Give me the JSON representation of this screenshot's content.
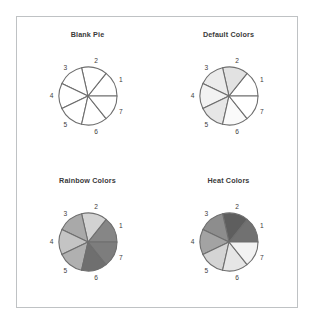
{
  "figure": {
    "background_color": "#ffffff",
    "border_color": "#bfc2c4",
    "layout": "2x2 grid of pie charts"
  },
  "chart_data": [
    {
      "type": "pie",
      "title": "Blank Pie",
      "labels": [
        "1",
        "2",
        "3",
        "4",
        "5",
        "6",
        "7"
      ],
      "values": [
        1,
        1,
        1,
        1,
        1,
        1,
        1
      ],
      "slice_percent": [
        14.3,
        14.3,
        14.3,
        14.3,
        14.3,
        14.3,
        14.3
      ],
      "colors": [
        "#ffffff",
        "#ffffff",
        "#ffffff",
        "#ffffff",
        "#ffffff",
        "#ffffff",
        "#ffffff"
      ],
      "border_color": "#6e6e6e",
      "legend": "none",
      "grid": false,
      "start_angle": 0
    },
    {
      "type": "pie",
      "title": "Default Colors",
      "labels": [
        "1",
        "2",
        "3",
        "4",
        "5",
        "6",
        "7"
      ],
      "values": [
        1,
        1,
        1,
        1,
        1,
        1,
        1
      ],
      "slice_percent": [
        14.3,
        14.3,
        14.3,
        14.3,
        14.3,
        14.3,
        14.3
      ],
      "colors": [
        "#ffffff",
        "#e2e2e2",
        "#ebebeb",
        "#f2f2f2",
        "#e6e6e6",
        "#fafafa",
        "#ffffff"
      ],
      "border_color": "#6e6e6e",
      "legend": "none",
      "grid": false,
      "start_angle": 0
    },
    {
      "type": "pie",
      "title": "Rainbow Colors",
      "labels": [
        "1",
        "2",
        "3",
        "4",
        "5",
        "6",
        "7"
      ],
      "values": [
        1,
        1,
        1,
        1,
        1,
        1,
        1
      ],
      "slice_percent": [
        14.3,
        14.3,
        14.3,
        14.3,
        14.3,
        14.3,
        14.3
      ],
      "colors": [
        "#868686",
        "#d2d2d2",
        "#a9a9a9",
        "#c4c4c4",
        "#b0b0b0",
        "#6f6f6f",
        "#7d7d7d"
      ],
      "border_color": "#6e6e6e",
      "legend": "none",
      "grid": false,
      "start_angle": 0
    },
    {
      "type": "pie",
      "title": "Heat Colors",
      "labels": [
        "1",
        "2",
        "3",
        "4",
        "5",
        "6",
        "7"
      ],
      "values": [
        1,
        1,
        1,
        1,
        1,
        1,
        1
      ],
      "slice_percent": [
        14.3,
        14.3,
        14.3,
        14.3,
        14.3,
        14.3,
        14.3
      ],
      "colors": [
        "#717171",
        "#5e5e5e",
        "#8d8d8d",
        "#a3a3a3",
        "#d4d4d4",
        "#e6e6e6",
        "#f2f2f2"
      ],
      "border_color": "#6e6e6e",
      "legend": "none",
      "grid": false,
      "start_angle": 0
    }
  ],
  "panels": [
    {
      "title": "Blank Pie"
    },
    {
      "title": "Default Colors"
    },
    {
      "title": "Rainbow Colors"
    },
    {
      "title": "Heat Colors"
    }
  ]
}
